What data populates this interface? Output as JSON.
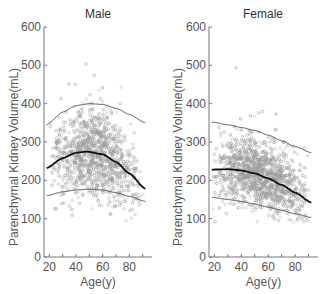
{
  "chart_data": [
    {
      "type": "scatter",
      "title": "Male",
      "xlabel": "Age(y)",
      "ylabel": "Parenchymal Kidney Volume(mL)",
      "xlim": [
        16,
        97
      ],
      "ylim": [
        0,
        600
      ],
      "xticks": [
        20,
        40,
        60,
        80
      ],
      "yticks": [
        0,
        100,
        200,
        300,
        400,
        500,
        600
      ],
      "grid": false,
      "legend": null,
      "point_color": "#9a9a9a",
      "scatter_distribution": {
        "x_range": [
          18,
          92
        ],
        "center_curve": "mean",
        "spread_mL": 55,
        "n": 1100
      },
      "series": [
        {
          "name": "upper",
          "x": [
            18,
            30,
            40,
            50,
            60,
            70,
            80,
            92
          ],
          "y": [
            345,
            378,
            395,
            400,
            398,
            388,
            372,
            350
          ],
          "stroke": "#555555",
          "width": 1
        },
        {
          "name": "mean",
          "x": [
            18,
            30,
            40,
            48,
            60,
            70,
            80,
            92
          ],
          "y": [
            232,
            258,
            272,
            275,
            268,
            248,
            218,
            178
          ],
          "stroke": "#111111",
          "width": 1.8
        },
        {
          "name": "lower",
          "x": [
            18,
            30,
            40,
            50,
            60,
            70,
            80,
            92
          ],
          "y": [
            160,
            170,
            175,
            177,
            175,
            168,
            158,
            145
          ],
          "stroke": "#555555",
          "width": 1
        }
      ]
    },
    {
      "type": "scatter",
      "title": "Female",
      "xlabel": "Age(y)",
      "ylabel": "Parenchymal Kidney Volume(mL)",
      "xlim": [
        16,
        97
      ],
      "ylim": [
        0,
        600
      ],
      "xticks": [
        20,
        40,
        60,
        80
      ],
      "yticks": [
        0,
        100,
        200,
        300,
        400,
        500,
        600
      ],
      "grid": false,
      "legend": null,
      "point_color": "#9a9a9a",
      "scatter_distribution": {
        "x_range": [
          18,
          92
        ],
        "center_curve": "mean",
        "spread_mL": 45,
        "n": 1300
      },
      "series": [
        {
          "name": "upper",
          "x": [
            18,
            30,
            40,
            50,
            60,
            70,
            80,
            92
          ],
          "y": [
            352,
            345,
            338,
            330,
            318,
            303,
            288,
            272
          ],
          "stroke": "#555555",
          "width": 1
        },
        {
          "name": "mean",
          "x": [
            18,
            30,
            40,
            50,
            60,
            70,
            80,
            92
          ],
          "y": [
            228,
            229,
            226,
            218,
            205,
            188,
            168,
            142
          ],
          "stroke": "#111111",
          "width": 1.8
        },
        {
          "name": "lower",
          "x": [
            18,
            30,
            40,
            50,
            60,
            70,
            80,
            92
          ],
          "y": [
            156,
            150,
            145,
            138,
            130,
            122,
            113,
            103
          ],
          "stroke": "#555555",
          "width": 1
        }
      ]
    }
  ],
  "panels": [
    {
      "title": "Male",
      "xlabel": "Age(y)",
      "ylabel": "Parenchymal Kidney Volume(mL)"
    },
    {
      "title": "Female",
      "xlabel": "Age(y)",
      "ylabel": "Parenchymal Kidney Volume(mL)"
    }
  ]
}
